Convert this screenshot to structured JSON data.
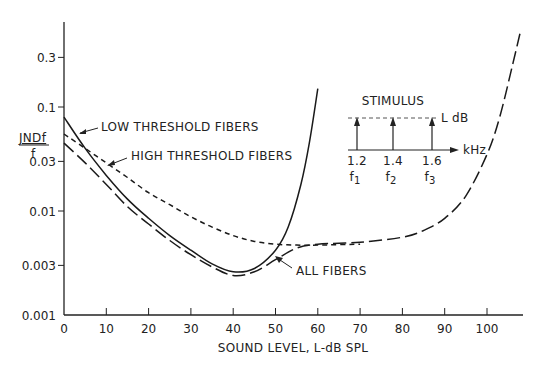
{
  "chart_data": {
    "type": "line",
    "title": "",
    "xlabel": "SOUND LEVEL, L-dB SPL",
    "ylabel": "JNDf / f",
    "ylabel_num": "JNDf",
    "ylabel_den": "f",
    "yscale": "log",
    "xlim": [
      0,
      108
    ],
    "ylim": [
      0.001,
      0.6
    ],
    "grid": false,
    "x_ticks": [
      0,
      10,
      20,
      30,
      40,
      50,
      60,
      70,
      80,
      90,
      100
    ],
    "x_tick_labels": [
      "0",
      "10",
      "20",
      "30",
      "40",
      "50",
      "60",
      "70",
      "80",
      "90",
      "100"
    ],
    "y_ticks": [
      0.001,
      0.003,
      0.01,
      0.03,
      0.1,
      0.3
    ],
    "y_tick_labels": [
      "0.001",
      "0.003",
      "0.01",
      "0.03",
      "0.1",
      "0.3"
    ],
    "series": [
      {
        "name": "LOW THRESHOLD FIBERS",
        "style": "solid",
        "x": [
          0,
          5,
          10,
          15,
          20,
          25,
          30,
          35,
          40,
          45,
          50,
          53,
          56,
          58,
          60
        ],
        "y": [
          0.08,
          0.04,
          0.022,
          0.013,
          0.0085,
          0.0058,
          0.0042,
          0.0031,
          0.0026,
          0.0028,
          0.0042,
          0.007,
          0.018,
          0.045,
          0.15
        ]
      },
      {
        "name": "HIGH THRESHOLD FIBERS",
        "style": "short-dash",
        "x": [
          0,
          5,
          10,
          15,
          20,
          25,
          30,
          35,
          40,
          45,
          50,
          55,
          60,
          70
        ],
        "y": [
          0.055,
          0.04,
          0.029,
          0.021,
          0.015,
          0.0115,
          0.0088,
          0.007,
          0.0058,
          0.0051,
          0.0048,
          0.0047,
          0.0047,
          0.0048
        ]
      },
      {
        "name": "ALL FIBERS",
        "style": "long-dash",
        "x": [
          0,
          5,
          10,
          15,
          20,
          25,
          30,
          35,
          40,
          45,
          50,
          55,
          60,
          70,
          80,
          85,
          90,
          95,
          100,
          103,
          106,
          108
        ],
        "y": [
          0.045,
          0.029,
          0.018,
          0.011,
          0.0075,
          0.0052,
          0.0038,
          0.0029,
          0.0024,
          0.0026,
          0.0034,
          0.0044,
          0.0048,
          0.005,
          0.0056,
          0.0065,
          0.0085,
          0.014,
          0.035,
          0.08,
          0.25,
          0.55
        ]
      }
    ],
    "annotations": [
      {
        "text": "LOW THRESHOLD FIBERS",
        "points_to": "low-threshold curve near L=3"
      },
      {
        "text": "HIGH THRESHOLD FIBERS",
        "points_to": "high-threshold curve near L=28"
      },
      {
        "text": "ALL FIBERS",
        "points_to": "all-fibers curve near L=51"
      }
    ],
    "inset": {
      "title": "STIMULUS",
      "level_label": "L dB",
      "axis_label": "kHz",
      "frequencies": [
        "1.2",
        "1.4",
        "1.6"
      ],
      "frequency_names": [
        "f1",
        "f2",
        "f3"
      ]
    }
  }
}
